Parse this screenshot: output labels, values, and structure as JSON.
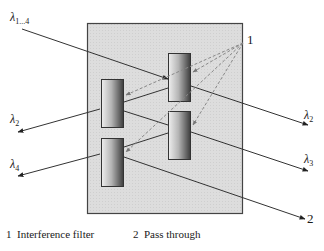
{
  "diagram": {
    "title": "",
    "labels": {
      "input": {
        "symbol": "λ",
        "sub": "1...4"
      },
      "out_left_top": {
        "symbol": "λ",
        "sub": "2"
      },
      "out_left_bottom": {
        "symbol": "λ",
        "sub": "4"
      },
      "out_right_top": {
        "symbol": "λ",
        "sub": "2"
      },
      "out_right_middle": {
        "symbol": "λ",
        "sub": "3"
      },
      "pointer_1": "1",
      "pointer_2": "2"
    },
    "legend": {
      "item1": "1  Interference filter",
      "item2": "2  Pass through"
    },
    "colors": {
      "housing_fill": "#dcdcdc",
      "housing_stroke": "#444444",
      "filter_dark": "#3a3a3a",
      "filter_light": "#e8e8e8",
      "line": "#333333",
      "dashed": "#888888"
    }
  }
}
